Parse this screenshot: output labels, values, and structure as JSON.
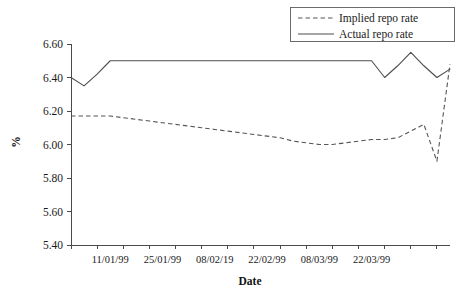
{
  "chart_data": {
    "type": "line",
    "title": "",
    "xlabel": "Date",
    "ylabel": "%",
    "ylim": [
      5.4,
      6.6
    ],
    "yticks": [
      5.4,
      5.6,
      5.8,
      6.0,
      6.2,
      6.4,
      6.6
    ],
    "ytick_labels": [
      "5.40",
      "5.60",
      "5.80",
      "6.00",
      "6.20",
      "6.40",
      "6.60"
    ],
    "grid": false,
    "legend_position": "top-right",
    "x_tick_labels": [
      "11/01/99",
      "25/01/99",
      "08/02/19",
      "22/02/99",
      "08/03/99",
      "22/03/99"
    ],
    "x_tick_positions": [
      3,
      7,
      11,
      15,
      19,
      23
    ],
    "x_index_range": [
      0,
      29
    ],
    "series": [
      {
        "name": "Implied repo rate",
        "style": "dashed",
        "color": "#555555",
        "x": [
          0,
          1,
          2,
          3,
          4,
          5,
          6,
          7,
          8,
          9,
          10,
          11,
          12,
          13,
          14,
          15,
          16,
          17,
          18,
          19,
          20,
          21,
          22,
          23,
          24,
          25,
          26,
          27,
          28,
          29
        ],
        "values": [
          6.17,
          6.17,
          6.17,
          6.17,
          6.16,
          6.15,
          6.14,
          6.13,
          6.12,
          6.11,
          6.1,
          6.09,
          6.08,
          6.07,
          6.06,
          6.05,
          6.04,
          6.02,
          6.01,
          6.0,
          6.0,
          6.01,
          6.02,
          6.03,
          6.03,
          6.04,
          6.08,
          6.12,
          5.9,
          6.48
        ]
      },
      {
        "name": "Actual repo rate",
        "style": "solid",
        "color": "#4d4d4d",
        "x": [
          0,
          1,
          2,
          3,
          4,
          5,
          6,
          7,
          8,
          9,
          10,
          11,
          12,
          13,
          14,
          15,
          16,
          17,
          18,
          19,
          20,
          21,
          22,
          23,
          24,
          25,
          26,
          27,
          28,
          29
        ],
        "values": [
          6.4,
          6.35,
          6.42,
          6.5,
          6.5,
          6.5,
          6.5,
          6.5,
          6.5,
          6.5,
          6.5,
          6.5,
          6.5,
          6.5,
          6.5,
          6.5,
          6.5,
          6.5,
          6.5,
          6.5,
          6.5,
          6.5,
          6.5,
          6.5,
          6.4,
          6.47,
          6.55,
          6.47,
          6.4,
          6.45
        ]
      }
    ]
  },
  "legend": {
    "items": [
      {
        "label": "Implied repo rate",
        "style": "dashed"
      },
      {
        "label": "Actual repo rate",
        "style": "solid"
      }
    ]
  }
}
